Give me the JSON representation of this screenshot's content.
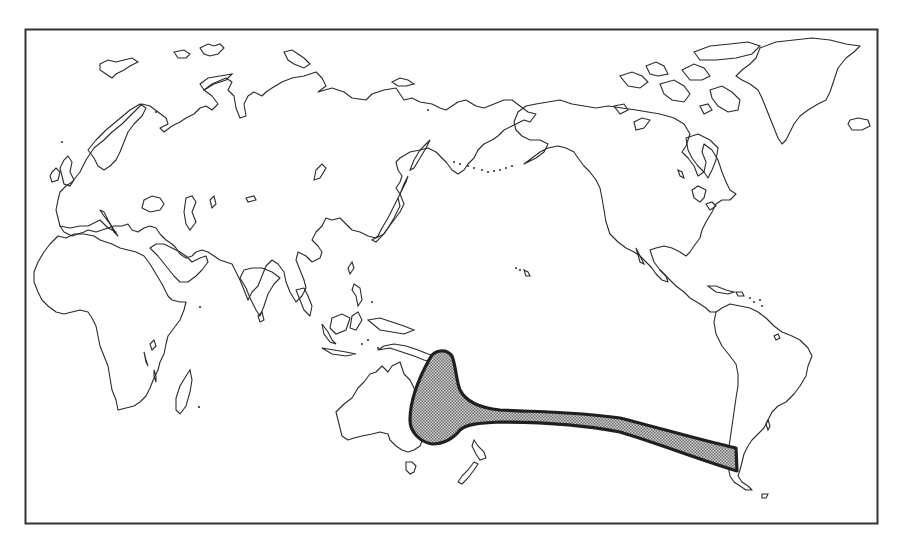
{
  "map": {
    "projection": "Pacific-centered world outline",
    "background_color": "#ffffff",
    "coastline_color": "#2a2a2a",
    "frame": {
      "x": 25,
      "y": 29,
      "width": 853,
      "height": 495,
      "stroke": "#333333"
    },
    "regions_depicted": [
      "Europe",
      "Africa",
      "Asia",
      "Australia",
      "New Zealand",
      "North America",
      "Greenland",
      "Iceland",
      "Central America",
      "South America"
    ],
    "distribution_range": {
      "description": "Shaded range from eastern Australia / Coral Sea across the South Pacific to central Chile",
      "fill_pattern": "stipple",
      "fill_color": "#9a9a9a",
      "outline_color": "#1f1f1f"
    },
    "labels": []
  }
}
